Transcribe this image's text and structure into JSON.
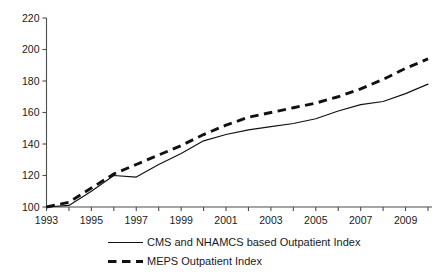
{
  "chart_data": {
    "type": "line",
    "title": "",
    "subtitle": "",
    "xlabel": "",
    "ylabel": "",
    "xlim": [
      1993,
      2010
    ],
    "ylim": [
      100,
      220
    ],
    "grid": false,
    "legend_position": "bottom",
    "y_ticks": [
      100,
      120,
      140,
      160,
      180,
      200,
      220
    ],
    "y_tick_labels": [
      "100",
      "120",
      "140",
      "160",
      "180",
      "200",
      "220"
    ],
    "x_ticks": [
      1993,
      1995,
      1997,
      1999,
      2001,
      2003,
      2005,
      2007,
      2009
    ],
    "x_tick_labels": [
      "1993",
      "1995",
      "1997",
      "1999",
      "2001",
      "2003",
      "2005",
      "2007",
      "2009"
    ],
    "x_minor_ticks": [
      1994,
      1996,
      1998,
      2000,
      2002,
      2004,
      2006,
      2008,
      2010
    ],
    "x": [
      1993,
      1994,
      1995,
      1996,
      1997,
      1998,
      1999,
      2000,
      2001,
      2002,
      2003,
      2004,
      2005,
      2006,
      2007,
      2008,
      2009,
      2010
    ],
    "series": [
      {
        "name": "CMS and NHAMCS based Outpatient Index",
        "style": "solid",
        "color": "#111111",
        "values": [
          100,
          101,
          110,
          120,
          119,
          127,
          134,
          142,
          146,
          149,
          151,
          153,
          156,
          161,
          165,
          167,
          172,
          178
        ]
      },
      {
        "name": "MEPS Outpatient Index",
        "style": "dashed",
        "color": "#111111",
        "values": [
          100,
          103,
          112,
          121,
          127,
          133,
          139,
          146,
          152,
          157,
          160,
          163,
          166,
          170,
          175,
          181,
          188,
          194
        ]
      }
    ]
  },
  "legend": {
    "items": [
      {
        "label": "CMS and NHAMCS based Outpatient Index",
        "style": "solid"
      },
      {
        "label": "MEPS Outpatient Index",
        "style": "dashed"
      }
    ]
  },
  "colors": {
    "line": "#111111",
    "axis": "#4d4d4d",
    "text": "#1a1a1a",
    "background": "#ffffff"
  }
}
